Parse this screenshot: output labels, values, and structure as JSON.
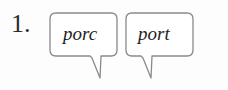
{
  "exercise": {
    "number_label": "1.",
    "stroke_color": "#8a8a8a",
    "text_color": "#1f1f1f",
    "background_color": "#fdfdfd",
    "bubbles": [
      {
        "word": "porc",
        "shape": "rounded-rectangle-speech-bubble",
        "tail_direction": "down-left"
      },
      {
        "word": "port",
        "shape": "rounded-rectangle-speech-bubble",
        "tail_direction": "down-left"
      }
    ]
  }
}
